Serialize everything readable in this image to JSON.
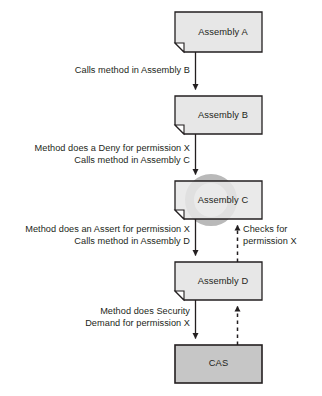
{
  "diagram": {
    "colors": {
      "assembly_fill": "#e7e7e7",
      "cas_fill": "#c6c6c6",
      "stroke": "#231f20",
      "text": "#231f20",
      "watermark": "#b8b8b8",
      "background": "#ffffff"
    },
    "nodes": [
      {
        "id": "assembly-a",
        "label": "Assembly A",
        "shape": "document-folded-corner",
        "fill": "#e7e7e7"
      },
      {
        "id": "assembly-b",
        "label": "Assembly B",
        "shape": "document-folded-corner",
        "fill": "#e7e7e7"
      },
      {
        "id": "assembly-c",
        "label": "Assembly C",
        "shape": "document-folded-corner",
        "fill": "#e7e7e7"
      },
      {
        "id": "assembly-d",
        "label": "Assembly D",
        "shape": "document-folded-corner",
        "fill": "#e7e7e7"
      },
      {
        "id": "cas",
        "label": "CAS",
        "shape": "rectangle",
        "fill": "#c6c6c6"
      }
    ],
    "edges": [
      {
        "id": "edge-a-to-b",
        "from": "assembly-a",
        "to": "assembly-b",
        "style": "solid",
        "direction": "down",
        "align": "right",
        "lines": [
          "Calls method in Assembly B"
        ]
      },
      {
        "id": "edge-b-to-c",
        "from": "assembly-b",
        "to": "assembly-c",
        "style": "solid",
        "direction": "down",
        "align": "right",
        "lines": [
          "Method does a Deny for permission X",
          "Calls method in Assembly C"
        ]
      },
      {
        "id": "edge-c-to-d",
        "from": "assembly-c",
        "to": "assembly-d",
        "style": "solid",
        "direction": "down",
        "align": "right",
        "lines": [
          "Method does an Assert for permission X",
          "Calls method in Assembly D"
        ]
      },
      {
        "id": "edge-d-to-cas",
        "from": "assembly-d",
        "to": "cas",
        "style": "solid",
        "direction": "down",
        "align": "right",
        "lines": [
          "Method does Security",
          "Demand for permission X"
        ]
      },
      {
        "id": "edge-d-to-c-check",
        "from": "assembly-d",
        "to": "assembly-c",
        "style": "dashed",
        "direction": "up",
        "align": "left",
        "lines": [
          "Checks for",
          "permission X"
        ]
      },
      {
        "id": "edge-cas-to-d-check",
        "from": "cas",
        "to": "assembly-d",
        "style": "dashed",
        "direction": "up",
        "align": "left",
        "lines": []
      }
    ]
  }
}
